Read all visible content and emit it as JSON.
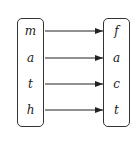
{
  "diagram": {
    "type": "mapping",
    "left_set": [
      "m",
      "a",
      "t",
      "h"
    ],
    "right_set": [
      "f",
      "a",
      "c",
      "t"
    ],
    "arrows": [
      {
        "from": "m",
        "to": "f"
      },
      {
        "from": "a",
        "to": "a"
      },
      {
        "from": "t",
        "to": "c"
      },
      {
        "from": "h",
        "to": "t"
      }
    ]
  }
}
